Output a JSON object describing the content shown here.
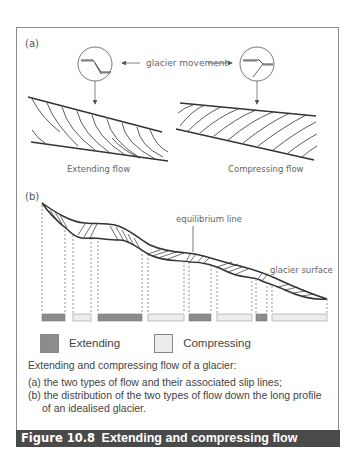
{
  "figure": {
    "number": "Figure 10.8",
    "title": "Extending and compressing flow"
  },
  "panel_a": {
    "label": "(a)",
    "movement_label": "glacier movement",
    "left_diagram": {
      "label": "Extending flow",
      "icon": "slip-plane-extending-icon"
    },
    "right_diagram": {
      "label": "Compressing flow",
      "icon": "slip-plane-compressing-icon"
    }
  },
  "panel_b": {
    "label": "(b)",
    "annotations": {
      "equilibrium_line": "equilibrium line",
      "glacier_surface": "glacier surface"
    },
    "flow_segments": [
      {
        "type": "extending",
        "x_start": 42,
        "x_end": 65
      },
      {
        "type": "compressing",
        "x_start": 73,
        "x_end": 91
      },
      {
        "type": "extending",
        "x_start": 98,
        "x_end": 142
      },
      {
        "type": "compressing",
        "x_start": 148,
        "x_end": 184
      },
      {
        "type": "extending",
        "x_start": 189,
        "x_end": 211
      },
      {
        "type": "compressing",
        "x_start": 217,
        "x_end": 252
      },
      {
        "type": "extending",
        "x_start": 256,
        "x_end": 267
      },
      {
        "type": "compressing",
        "x_start": 272,
        "x_end": 327
      }
    ]
  },
  "legend": {
    "extending": {
      "label": "Extending",
      "color": "#8c8c8c"
    },
    "compressing": {
      "label": "Compressing",
      "color": "#ececec"
    }
  },
  "description": {
    "intro": "Extending and compressing flow of a glacier:",
    "items": [
      "(a) the two types of flow and their associated slip lines;",
      "(b) the distribution of the two types of flow down the long profile of an idealised glacier."
    ]
  },
  "colors": {
    "frame_border": "#8a8a8a",
    "caption_bg": "#4a4a4a",
    "caption_text": "#ffffff",
    "line": "#333333"
  }
}
